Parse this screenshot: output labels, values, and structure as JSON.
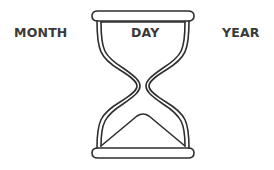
{
  "labels": {
    "left": "MONTH",
    "center": "DAY",
    "right": "YEAR"
  },
  "icon": "hourglass-icon",
  "colors": {
    "stroke": "#2e2e2e",
    "text": "#3a3a3a",
    "background": "#ffffff"
  }
}
